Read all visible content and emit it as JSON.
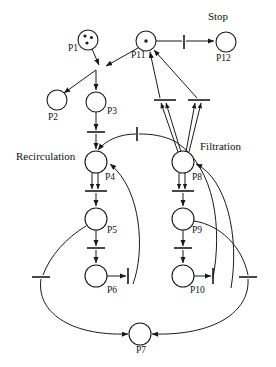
{
  "diagram": {
    "kind": "petri-net",
    "captions": [
      {
        "id": "cap_stop",
        "text": "Stop",
        "x": 218,
        "y": 20,
        "anchor": "middle"
      },
      {
        "id": "cap_recirculation",
        "text": "Recirculation",
        "x": 16,
        "y": 160,
        "anchor": "start"
      },
      {
        "id": "cap_filtration",
        "text": "Filtration",
        "x": 200,
        "y": 150,
        "anchor": "start"
      }
    ],
    "places": [
      {
        "id": "P1",
        "label": "P1",
        "cx": 88,
        "cy": 40,
        "r": 10,
        "tokens": 3,
        "label_x": 68,
        "label_y": 51
      },
      {
        "id": "P2",
        "label": "P2",
        "cx": 57,
        "cy": 100,
        "r": 10,
        "tokens": 0,
        "label_x": 48,
        "label_y": 120
      },
      {
        "id": "P3",
        "label": "P3",
        "cx": 96,
        "cy": 102,
        "r": 10,
        "tokens": 0,
        "label_x": 107,
        "label_y": 114
      },
      {
        "id": "P4",
        "label": "P4",
        "cx": 96,
        "cy": 162,
        "r": 11,
        "tokens": 0,
        "label_x": 105,
        "label_y": 180
      },
      {
        "id": "P5",
        "label": "P5",
        "cx": 96,
        "cy": 219,
        "r": 11,
        "tokens": 0,
        "label_x": 107,
        "label_y": 233
      },
      {
        "id": "P6",
        "label": "P6",
        "cx": 96,
        "cy": 276,
        "r": 11,
        "tokens": 0,
        "label_x": 107,
        "label_y": 293
      },
      {
        "id": "P7",
        "label": "P7",
        "cx": 140,
        "cy": 334,
        "r": 11,
        "tokens": 0,
        "label_x": 136,
        "label_y": 353
      },
      {
        "id": "P8",
        "label": "P8",
        "cx": 183,
        "cy": 162,
        "r": 11,
        "tokens": 0,
        "label_x": 192,
        "label_y": 180
      },
      {
        "id": "P9",
        "label": "P9",
        "cx": 183,
        "cy": 219,
        "r": 11,
        "tokens": 0,
        "label_x": 192,
        "label_y": 233
      },
      {
        "id": "P10",
        "label": "P10",
        "cx": 183,
        "cy": 276,
        "r": 11,
        "tokens": 0,
        "label_x": 190,
        "label_y": 293
      },
      {
        "id": "P11",
        "label": "P11",
        "cx": 146,
        "cy": 41,
        "r": 10,
        "tokens": 1,
        "label_x": 133,
        "label_y": 58
      },
      {
        "id": "P12",
        "label": "P12",
        "cx": 226,
        "cy": 42,
        "r": 10,
        "tokens": 0,
        "label_x": 217,
        "label_y": 61
      }
    ],
    "transitions": [
      {
        "id": "t_stop",
        "orient": "v",
        "x": 184,
        "y": 42,
        "len": 14,
        "note": "P11 to P12 stop transition"
      },
      {
        "id": "t_p3",
        "orient": "h",
        "x": 96,
        "y": 133,
        "len": 18,
        "note": "below P3"
      },
      {
        "id": "t_p4",
        "orient": "h",
        "x": 96,
        "y": 192,
        "len": 22,
        "note": "below P4"
      },
      {
        "id": "t_p5",
        "orient": "h",
        "x": 96,
        "y": 249,
        "len": 18,
        "note": "below P5"
      },
      {
        "id": "t_p6",
        "orient": "v",
        "x": 128,
        "y": 276,
        "len": 16,
        "note": "right of P6"
      },
      {
        "id": "t_p8",
        "orient": "h",
        "x": 183,
        "y": 192,
        "len": 22,
        "note": "below P8"
      },
      {
        "id": "t_p9",
        "orient": "h",
        "x": 183,
        "y": 249,
        "len": 18,
        "note": "below P9"
      },
      {
        "id": "t_p10",
        "orient": "v",
        "x": 213,
        "y": 276,
        "len": 16,
        "note": "right of P10"
      },
      {
        "id": "t_up_l",
        "orient": "h",
        "x": 158,
        "y": 100,
        "len": 20,
        "note": "left feeder to P11"
      },
      {
        "id": "t_up_r",
        "orient": "h",
        "x": 194,
        "y": 100,
        "len": 20,
        "note": "right feeder to P11"
      },
      {
        "id": "t_mid",
        "orient": "v",
        "x": 137,
        "y": 134,
        "len": 14,
        "note": "arc into P4 from right loop"
      },
      {
        "id": "t_bl",
        "orient": "h",
        "x": 41,
        "y": 277,
        "len": 18,
        "note": "left outer loop"
      },
      {
        "id": "t_br",
        "orient": "h",
        "x": 248,
        "y": 277,
        "len": 18,
        "note": "right outer loop"
      }
    ],
    "tokens_legend": {
      "P1": 3,
      "P11": 1
    },
    "colors": {
      "stroke": "#1a1a1a",
      "fill": "#ffffff",
      "text": "#111111"
    }
  }
}
